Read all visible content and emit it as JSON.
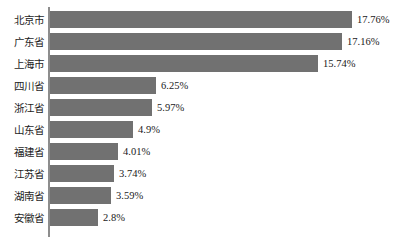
{
  "chart_data": {
    "type": "bar",
    "orientation": "horizontal",
    "title": "",
    "subtitle": "",
    "xlabel": "",
    "ylabel": "",
    "xlim": [
      0,
      20
    ],
    "grid": false,
    "legend": null,
    "value_suffix": "%",
    "categories": [
      "北京市",
      "广东省",
      "上海市",
      "四川省",
      "浙江省",
      "山东省",
      "福建省",
      "江苏省",
      "湖南省",
      "安徽省"
    ],
    "values": [
      17.76,
      17.16,
      15.74,
      6.25,
      5.97,
      4.9,
      4.01,
      3.74,
      3.59,
      2.8
    ],
    "value_labels": [
      "17.76%",
      "17.16%",
      "15.74%",
      "6.25%",
      "5.97%",
      "4.9%",
      "4.01%",
      "3.74%",
      "3.59%",
      "2.8%"
    ],
    "bars": [
      {
        "category": "北京市",
        "value": 17.76,
        "label": "17.76%"
      },
      {
        "category": "广东省",
        "value": 17.16,
        "label": "17.16%"
      },
      {
        "category": "上海市",
        "value": 15.74,
        "label": "15.74%"
      },
      {
        "category": "四川省",
        "value": 6.25,
        "label": "6.25%"
      },
      {
        "category": "浙江省",
        "value": 5.97,
        "label": "5.97%"
      },
      {
        "category": "山东省",
        "value": 4.9,
        "label": "4.9%"
      },
      {
        "category": "福建省",
        "value": 4.01,
        "label": "4.01%"
      },
      {
        "category": "江苏省",
        "value": 3.74,
        "label": "3.74%"
      },
      {
        "category": "湖南省",
        "value": 3.59,
        "label": "3.59%"
      },
      {
        "category": "安徽省",
        "value": 2.8,
        "label": "2.8%"
      }
    ]
  },
  "style": {
    "bar_color": "#717171",
    "axis_color": "#8d8d8d",
    "text_color": "#1a1a1a",
    "background": "#ffffff"
  }
}
